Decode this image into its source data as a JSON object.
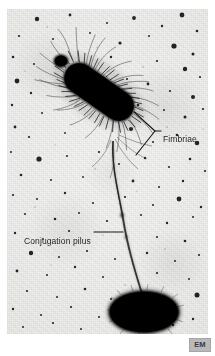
{
  "figure": {
    "kind": "electron-micrograph",
    "background_color": "#efefed",
    "ink_color": "#0b0b0b",
    "annotation_color": "#1b1b1b"
  },
  "annotations": [
    {
      "id": "fimbriae",
      "label": "Fimbriae",
      "pointer": "chevron-bracket",
      "side": "right"
    },
    {
      "id": "conjugation-pilus",
      "label": "Conjugation pilus",
      "pointer": "leader-line",
      "side": "left"
    }
  ],
  "structures": {
    "upper_cell": "fimbriated rod-shaped bacterium",
    "lower_cell": "smooth oval bacterium",
    "connector": "conjugation pilus",
    "bleb": "terminal bleb"
  },
  "badge": {
    "label": "EM",
    "background_color": "#b9b9b9",
    "text_color": "#3a3a3a"
  }
}
